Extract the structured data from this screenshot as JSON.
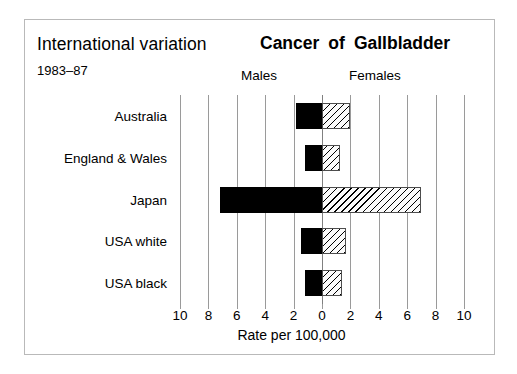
{
  "figure": {
    "left_title": "International variation",
    "subtitle": "1983–87",
    "main_title_words": [
      "Cancer",
      "of",
      "Gallbladder"
    ],
    "main_title": "Cancer of Gallbladder",
    "group_labels": {
      "left": "Males",
      "right": "Females"
    },
    "axis_title": "Rate per 100,000",
    "frame_color": "#b9b9b9",
    "gridline_color": "#9a9a9a",
    "male_color": "#000000",
    "female_color": "#ffffff"
  },
  "chart_data": {
    "type": "bar",
    "orientation": "horizontal",
    "style": "population-pyramid / back-to-back bar",
    "subtitle": "International variation 1983–87",
    "xlabel": "Rate per 100,000",
    "ylabel": "",
    "categories": [
      "Australia",
      "England & Wales",
      "Japan",
      "USA white",
      "USA black"
    ],
    "series": [
      {
        "name": "Males",
        "side": "left",
        "values": [
          1.8,
          1.2,
          7.2,
          1.5,
          1.2
        ]
      },
      {
        "name": "Females",
        "side": "right",
        "values": [
          2.0,
          1.3,
          7.0,
          1.7,
          1.4
        ]
      }
    ],
    "xlim": [
      -10,
      10
    ],
    "xticks": [
      -10,
      -8,
      -6,
      -4,
      -2,
      0,
      2,
      4,
      6,
      8,
      10
    ],
    "xtick_labels": [
      "10",
      "8",
      "6",
      "4",
      "2",
      "0",
      "2",
      "4",
      "6",
      "8",
      "10"
    ],
    "grid": true,
    "legend": "inline group headers (Males left, Females right)"
  }
}
